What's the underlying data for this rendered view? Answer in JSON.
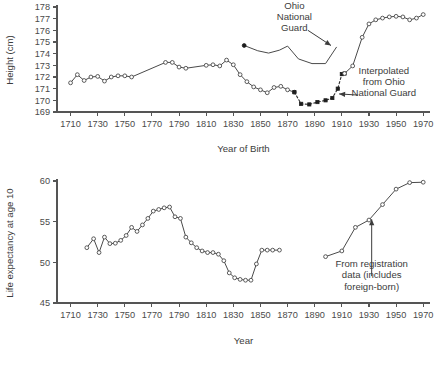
{
  "figure": {
    "title": "",
    "panels": [
      "height-panel",
      "life-expectancy-panel"
    ]
  },
  "chart_data": [
    {
      "id": "height-panel",
      "type": "line",
      "title": "",
      "xlabel": "Year of Birth",
      "ylabel": "Height (cm)",
      "xlim": [
        1700,
        1975
      ],
      "ylim": [
        169,
        178
      ],
      "grid": false,
      "legend": "none",
      "xticks": [
        1710,
        1730,
        1750,
        1770,
        1790,
        1810,
        1830,
        1850,
        1870,
        1890,
        1910,
        1930,
        1950,
        1970
      ],
      "yticks": [
        169,
        170,
        171,
        172,
        173,
        174,
        175,
        176,
        177,
        178
      ],
      "series": [
        {
          "name": "Native-born white males (open circles)",
          "marker": "open-circle",
          "linestyle": "solid",
          "x": [
            1710,
            1715,
            1720,
            1725,
            1730,
            1735,
            1740,
            1745,
            1750,
            1755,
            1780,
            1785,
            1790,
            1795,
            1810,
            1815,
            1820,
            1825,
            1830,
            1835,
            1840,
            1845,
            1850,
            1855,
            1860,
            1865,
            1870,
            1875
          ],
          "y": [
            171.5,
            172.2,
            171.7,
            172.0,
            172.05,
            171.65,
            172.0,
            172.1,
            172.1,
            172.0,
            173.25,
            173.25,
            172.85,
            172.75,
            173.0,
            173.05,
            172.95,
            173.45,
            173.05,
            172.2,
            171.6,
            171.15,
            170.9,
            170.65,
            171.1,
            171.2,
            170.9,
            170.7
          ]
        },
        {
          "name": "Ohio National Guard",
          "marker": "filled-start",
          "linestyle": "solid",
          "x": [
            1838,
            1848,
            1856,
            1864,
            1870,
            1878,
            1888,
            1898,
            1906
          ],
          "y": [
            174.7,
            174.25,
            174.05,
            174.3,
            174.65,
            173.55,
            173.15,
            173.15,
            174.55
          ]
        },
        {
          "name": "Interpolated from Ohio National Guard",
          "marker": "filled-square",
          "linestyle": "dashed",
          "x": [
            1875,
            1880,
            1886,
            1892,
            1898,
            1903,
            1907,
            1910,
            1912
          ],
          "y": [
            170.7,
            169.7,
            169.65,
            169.85,
            170.0,
            170.2,
            171.0,
            172.25,
            172.3
          ]
        },
        {
          "name": "Modern series (open circles)",
          "marker": "open-circle",
          "linestyle": "solid",
          "x": [
            1912,
            1918,
            1925,
            1930,
            1935,
            1940,
            1945,
            1950,
            1955,
            1960,
            1965,
            1970
          ],
          "y": [
            172.3,
            172.95,
            175.4,
            176.55,
            176.9,
            177.05,
            177.15,
            177.2,
            177.15,
            176.9,
            177.05,
            177.35
          ]
        }
      ],
      "annotations": [
        {
          "id": "ohio-national-guard-annotation",
          "text": [
            "Ohio",
            "National",
            "Guard"
          ],
          "text_x": 1875,
          "text_y_top": 177.85,
          "arrow_from": [
            1885,
            176.0
          ],
          "arrow_to": [
            1902,
            174.7
          ]
        },
        {
          "id": "interpolated-annotation",
          "text": [
            "Interpolated",
            "from Ohio",
            "National Guard"
          ],
          "text_x": 1941,
          "text_y_top": 172.3,
          "arrow_from": [
            1922,
            170.45
          ],
          "arrow_to": [
            1908,
            170.55
          ]
        }
      ]
    },
    {
      "id": "life-expectancy-panel",
      "type": "line",
      "title": "",
      "xlabel": "Year",
      "ylabel": "Life expectancy at age 10",
      "xlim": [
        1700,
        1975
      ],
      "ylim": [
        45,
        60
      ],
      "grid": false,
      "legend": "none",
      "xticks": [
        1710,
        1730,
        1750,
        1770,
        1790,
        1810,
        1830,
        1850,
        1870,
        1890,
        1910,
        1930,
        1950,
        1970
      ],
      "yticks": [
        45,
        50,
        55,
        60
      ],
      "series": [
        {
          "name": "Genealogical / family-history estimates",
          "marker": "open-circle",
          "linestyle": "solid",
          "x": [
            1722,
            1727,
            1731,
            1735,
            1739,
            1743,
            1747,
            1751,
            1755,
            1759,
            1763,
            1767,
            1771,
            1775,
            1779,
            1783,
            1787,
            1791,
            1795,
            1799,
            1803,
            1807,
            1811,
            1815,
            1819,
            1823,
            1827,
            1831,
            1835,
            1839,
            1843,
            1847,
            1851,
            1855,
            1859,
            1864
          ],
          "y": [
            51.8,
            52.9,
            51.2,
            53.1,
            52.3,
            52.35,
            52.7,
            53.3,
            54.3,
            53.8,
            54.6,
            55.4,
            56.3,
            56.5,
            56.7,
            56.8,
            55.6,
            55.4,
            53.1,
            52.4,
            51.8,
            51.4,
            51.2,
            51.2,
            51.0,
            50.2,
            48.7,
            48.1,
            47.9,
            47.8,
            47.8,
            49.8,
            51.5,
            51.5,
            51.5,
            51.5
          ]
        },
        {
          "name": "From registration data (includes foreign-born)",
          "marker": "open-circle",
          "linestyle": "solid",
          "x": [
            1898,
            1910,
            1920,
            1930,
            1940,
            1950,
            1960,
            1970
          ],
          "y": [
            50.7,
            51.4,
            54.3,
            55.2,
            57.1,
            59.0,
            59.8,
            59.85
          ]
        }
      ],
      "annotations": [
        {
          "id": "registration-data-annotation",
          "text": [
            "From registration",
            "data (includes",
            "foreign-born)"
          ],
          "text_x": 1932,
          "text_y_top": 49.4,
          "arrow_from": [
            1932,
            48.3
          ],
          "arrow_to": [
            1932,
            55.3
          ]
        }
      ]
    }
  ]
}
